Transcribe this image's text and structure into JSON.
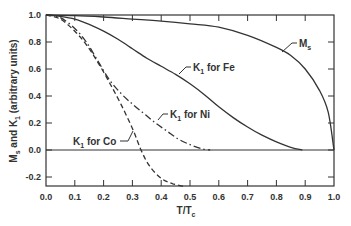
{
  "chart_data": {
    "type": "line",
    "title": "",
    "xlabel": "T/T",
    "xlabel_sub": "c",
    "ylabel_parts": [
      "M",
      "s",
      " and K",
      "1",
      " (arbitrary units)"
    ],
    "ylabel": "Ms and K1 (arbitrary units)",
    "xlim": [
      0.0,
      1.0
    ],
    "ylim": [
      -0.27,
      1.0
    ],
    "x_ticks": [
      "0.0",
      "0.1",
      "0.2",
      "0.3",
      "0.4",
      "0.5",
      "0.6",
      "0.7",
      "0.8",
      "0.9",
      "1.0"
    ],
    "y_ticks": [
      "1.0",
      "0.8",
      "0.6",
      "0.4",
      "0.2",
      "0.0",
      "-0.2"
    ],
    "grid": false,
    "zero_line": true,
    "series": [
      {
        "name": "Ms",
        "label_main": "M",
        "label_sub": "s",
        "style": "solid",
        "x": [
          0.0,
          0.1,
          0.2,
          0.3,
          0.4,
          0.5,
          0.6,
          0.7,
          0.8,
          0.85,
          0.9,
          0.95,
          0.98,
          1.0
        ],
        "y": [
          1.0,
          0.995,
          0.985,
          0.97,
          0.955,
          0.935,
          0.91,
          0.85,
          0.76,
          0.7,
          0.6,
          0.44,
          0.28,
          0.0
        ]
      },
      {
        "name": "K1 for Fe",
        "label_main": "K",
        "label_sub": "1",
        "label_rest": " for Fe",
        "style": "solid",
        "x": [
          0.0,
          0.05,
          0.1,
          0.15,
          0.2,
          0.25,
          0.3,
          0.35,
          0.4,
          0.45,
          0.5,
          0.55,
          0.6,
          0.65,
          0.7,
          0.75,
          0.8,
          0.85,
          0.89
        ],
        "y": [
          1.0,
          0.99,
          0.97,
          0.93,
          0.88,
          0.82,
          0.75,
          0.68,
          0.62,
          0.56,
          0.49,
          0.41,
          0.32,
          0.24,
          0.17,
          0.11,
          0.06,
          0.02,
          0.0
        ]
      },
      {
        "name": "K1 for Ni",
        "label_main": "K",
        "label_sub": "1",
        "label_rest": " for Ni",
        "style": "dashdot",
        "x": [
          0.0,
          0.05,
          0.1,
          0.14,
          0.18,
          0.22,
          0.26,
          0.3,
          0.34,
          0.38,
          0.42,
          0.46,
          0.5,
          0.54,
          0.57
        ],
        "y": [
          1.0,
          0.98,
          0.9,
          0.8,
          0.66,
          0.52,
          0.42,
          0.34,
          0.27,
          0.2,
          0.14,
          0.08,
          0.04,
          0.01,
          0.0
        ]
      },
      {
        "name": "K1 for Co",
        "label_main": "K",
        "label_sub": "1",
        "label_rest": " for Co",
        "style": "dashed",
        "x": [
          0.0,
          0.05,
          0.1,
          0.14,
          0.18,
          0.22,
          0.26,
          0.3,
          0.33,
          0.36,
          0.4,
          0.44,
          0.48
        ],
        "y": [
          1.0,
          0.97,
          0.88,
          0.78,
          0.65,
          0.5,
          0.34,
          0.16,
          0.0,
          -0.12,
          -0.21,
          -0.25,
          -0.27
        ]
      }
    ],
    "annotations": [
      {
        "text": "Ms",
        "series": "Ms"
      },
      {
        "text": "K1 for Fe",
        "series": "K1 for Fe"
      },
      {
        "text": "K1 for Ni",
        "series": "K1 for Ni"
      },
      {
        "text": "K1 for Co",
        "series": "K1 for Co"
      }
    ]
  },
  "labels": {
    "ms_main": "M",
    "ms_sub": "s",
    "k": "K",
    "k_sub": "1",
    "fe_rest": " for Fe",
    "ni_rest": " for Ni",
    "co_rest": " for Co",
    "x_main": "T/T",
    "x_sub": "c",
    "y_m": "M",
    "y_s": "s",
    "y_and": " and K",
    "y_1": "1",
    "y_rest": " (arbitrary units)"
  }
}
